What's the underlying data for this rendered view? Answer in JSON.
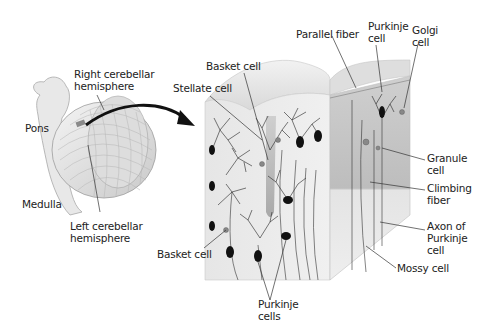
{
  "figure": {
    "colors": {
      "background": "#ffffff",
      "tissue_light": "#ececec",
      "tissue_mid": "#d6d6d6",
      "tissue_dark": "#bdbdbd",
      "neuron": "#111111",
      "arrow": "#111111",
      "label_text": "#222222",
      "leader_line": "#333333"
    }
  },
  "labels": {
    "right_hemisphere": "Right cerebellar\nhemisphere",
    "pons": "Pons",
    "medulla": "Medulla",
    "left_hemisphere": "Left cerebellar\nhemisphere",
    "basket_cell_top": "Basket cell",
    "stellate_cell": "Stellate cell",
    "parallel_fiber": "Parallel fiber",
    "purkinje_cell_top": "Purkinje\ncell",
    "golgi_cell": "Golgi\ncell",
    "granule_cell": "Granule\ncell",
    "climbing_fiber": "Climbing\nfiber",
    "axon_of_purkinje": "Axon of\nPurkinje\ncell",
    "mossy_cell": "Mossy cell",
    "basket_cell_bottom": "Basket cell",
    "purkinje_cells_bottom": "Purkinje\ncells"
  }
}
